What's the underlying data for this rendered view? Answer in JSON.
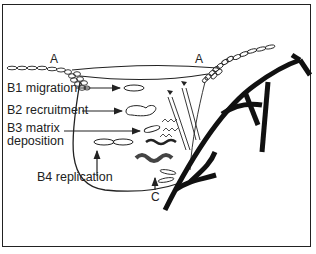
{
  "figure": {
    "labels": {
      "a_left": "A",
      "a_right": "A",
      "b1": "B1 migration",
      "b2": "B2 recruitment",
      "b3_line1": "B3 matrix",
      "b3_line2": "deposition",
      "b4": "B4 replication",
      "c": "C"
    },
    "colors": {
      "ink": "#222222",
      "background": "#ffffff"
    }
  }
}
